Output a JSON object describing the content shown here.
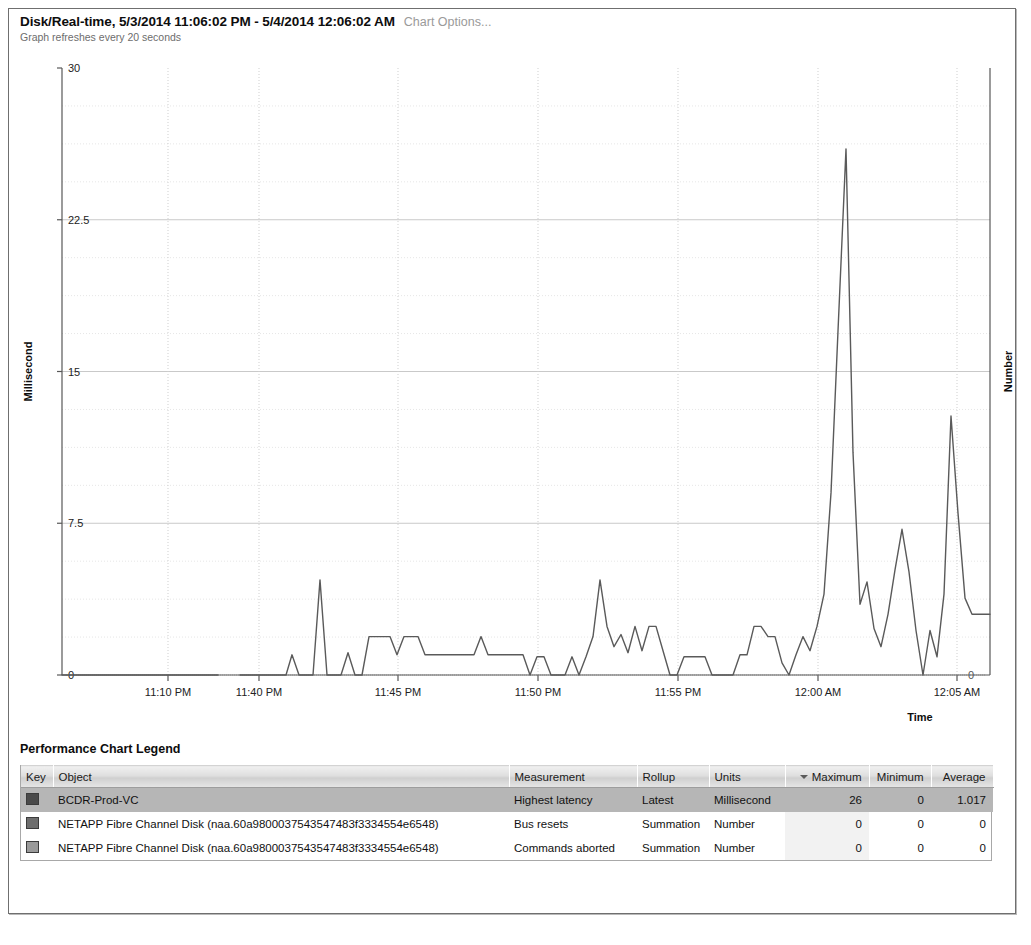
{
  "header": {
    "title": "Disk/Real-time, 5/3/2014 11:06:02 PM - 5/4/2014 12:06:02 AM",
    "options_link": "Chart Options...",
    "refresh_note": "Graph refreshes every 20 seconds"
  },
  "legend": {
    "title": "Performance Chart Legend",
    "columns": [
      "Key",
      "Object",
      "Measurement",
      "Rollup",
      "Units",
      "Maximum",
      "Minimum",
      "Average"
    ],
    "sorted_column": "Maximum",
    "sort_direction": "descending",
    "rows": [
      {
        "key_color": "#4a4a4a",
        "object": "BCDR-Prod-VC",
        "measurement": "Highest latency",
        "rollup": "Latest",
        "units": "Millisecond",
        "maximum": "26",
        "minimum": "0",
        "average": "1.017",
        "selected": true
      },
      {
        "key_color": "#6e6e6e",
        "object": "NETAPP Fibre Channel Disk (naa.60a9800037543547483f3334554e6548)",
        "measurement": "Bus resets",
        "rollup": "Summation",
        "units": "Number",
        "maximum": "0",
        "minimum": "0",
        "average": "0",
        "selected": false
      },
      {
        "key_color": "#9a9a9a",
        "object": "NETAPP Fibre Channel Disk (naa.60a9800037543547483f3334554e6548)",
        "measurement": "Commands aborted",
        "rollup": "Summation",
        "units": "Number",
        "maximum": "0",
        "minimum": "0",
        "average": "0",
        "selected": false
      }
    ]
  },
  "chart_data": {
    "type": "line",
    "title": "Disk/Real-time, 5/3/2014 11:06:02 PM - 5/4/2014 12:06:02 AM",
    "xlabel": "Time",
    "ylabel": "Millisecond",
    "y2label": "Number",
    "ylim": [
      0,
      30
    ],
    "yticks": [
      0,
      7.5,
      15,
      22.5,
      30
    ],
    "yticklabels": [
      "0",
      "7.5",
      "15",
      "22.5",
      "30"
    ],
    "y2ticks": [
      0
    ],
    "y2ticklabels": [
      "0"
    ],
    "grid": true,
    "legend_position": "below-table",
    "xticklabels": [
      "11:10 PM",
      "11:40 PM",
      "11:45 PM",
      "11:50 PM",
      "11:55 PM",
      "12:00 AM",
      "12:05 AM"
    ],
    "xtick_positions_px": [
      168,
      259,
      398,
      538,
      678,
      818,
      957
    ],
    "series": [
      {
        "name": "Highest latency",
        "units": "Millisecond",
        "color": "#5a5a5a",
        "maximum": 26,
        "minimum": 0,
        "average": 1.017,
        "points": [
          [
            62,
            0
          ],
          [
            80,
            0
          ],
          [
            100,
            0
          ],
          [
            120,
            0
          ],
          [
            140,
            0
          ],
          [
            160,
            0
          ],
          [
            180,
            0
          ],
          [
            200,
            0
          ],
          [
            218,
            0
          ],
          [
            240,
            0
          ],
          [
            258,
            0
          ],
          [
            268,
            0
          ],
          [
            278,
            0
          ],
          [
            286,
            0
          ],
          [
            292,
            1.0
          ],
          [
            299,
            0
          ],
          [
            306,
            0
          ],
          [
            313,
            0
          ],
          [
            320,
            4.7
          ],
          [
            327,
            0
          ],
          [
            334,
            0
          ],
          [
            341,
            0
          ],
          [
            348,
            1.1
          ],
          [
            355,
            0
          ],
          [
            362,
            0
          ],
          [
            369,
            1.9
          ],
          [
            376,
            1.9
          ],
          [
            383,
            1.9
          ],
          [
            390,
            1.9
          ],
          [
            397,
            1.0
          ],
          [
            404,
            1.9
          ],
          [
            411,
            1.9
          ],
          [
            418,
            1.9
          ],
          [
            425,
            1.0
          ],
          [
            432,
            1.0
          ],
          [
            439,
            1.0
          ],
          [
            446,
            1.0
          ],
          [
            453,
            1.0
          ],
          [
            460,
            1.0
          ],
          [
            467,
            1.0
          ],
          [
            474,
            1.0
          ],
          [
            481,
            1.9
          ],
          [
            488,
            1.0
          ],
          [
            495,
            1.0
          ],
          [
            502,
            1.0
          ],
          [
            509,
            1.0
          ],
          [
            516,
            1.0
          ],
          [
            523,
            1.0
          ],
          [
            530,
            0
          ],
          [
            537,
            0.9
          ],
          [
            544,
            0.9
          ],
          [
            551,
            0
          ],
          [
            558,
            0
          ],
          [
            565,
            0
          ],
          [
            572,
            0.9
          ],
          [
            579,
            0
          ],
          [
            586,
            0.9
          ],
          [
            593,
            1.9
          ],
          [
            600,
            4.7
          ],
          [
            607,
            2.4
          ],
          [
            614,
            1.4
          ],
          [
            621,
            2.0
          ],
          [
            628,
            1.1
          ],
          [
            635,
            2.4
          ],
          [
            642,
            1.2
          ],
          [
            649,
            2.4
          ],
          [
            656,
            2.4
          ],
          [
            663,
            1.2
          ],
          [
            670,
            0
          ],
          [
            677,
            0
          ],
          [
            684,
            0.9
          ],
          [
            691,
            0.9
          ],
          [
            698,
            0.9
          ],
          [
            705,
            0.9
          ],
          [
            712,
            0
          ],
          [
            719,
            0
          ],
          [
            726,
            0
          ],
          [
            733,
            0
          ],
          [
            740,
            1.0
          ],
          [
            747,
            1.0
          ],
          [
            754,
            2.4
          ],
          [
            761,
            2.4
          ],
          [
            768,
            1.9
          ],
          [
            775,
            1.9
          ],
          [
            782,
            0.6
          ],
          [
            789,
            0
          ],
          [
            796,
            1.0
          ],
          [
            803,
            1.9
          ],
          [
            810,
            1.2
          ],
          [
            817,
            2.4
          ],
          [
            824,
            4.0
          ],
          [
            831,
            9.0
          ],
          [
            838,
            17.0
          ],
          [
            846,
            26.0
          ],
          [
            853,
            11.0
          ],
          [
            860,
            3.5
          ],
          [
            867,
            4.6
          ],
          [
            874,
            2.3
          ],
          [
            881,
            1.4
          ],
          [
            888,
            3.0
          ],
          [
            895,
            5.2
          ],
          [
            902,
            7.2
          ],
          [
            909,
            5.1
          ],
          [
            916,
            2.2
          ],
          [
            923,
            0
          ],
          [
            930,
            2.2
          ],
          [
            937,
            0.9
          ],
          [
            944,
            4.0
          ],
          [
            951,
            12.8
          ],
          [
            958,
            8.0
          ],
          [
            965,
            3.8
          ],
          [
            972,
            3.0
          ],
          [
            979,
            3.0
          ],
          [
            986,
            3.0
          ],
          [
            990,
            3.0
          ]
        ],
        "break_after_px": 218
      }
    ]
  }
}
